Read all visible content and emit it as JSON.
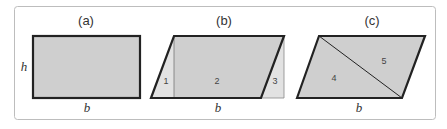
{
  "figure": {
    "colors": {
      "frame": "#bdbdbd",
      "fill": "#cfcfcf",
      "light_fill": "#e2e2e2",
      "stroke": "#222222"
    },
    "panels": [
      {
        "label": "(a)",
        "height_label": "h",
        "base_label": "b",
        "shape": "rectangle"
      },
      {
        "label": "(b)",
        "base_label": "b",
        "shape": "parallelogram-decomposed",
        "regions": [
          "1",
          "2",
          "3"
        ]
      },
      {
        "label": "(c)",
        "base_label": "b",
        "shape": "parallelogram-diagonal",
        "regions": [
          "4",
          "5"
        ]
      }
    ]
  }
}
